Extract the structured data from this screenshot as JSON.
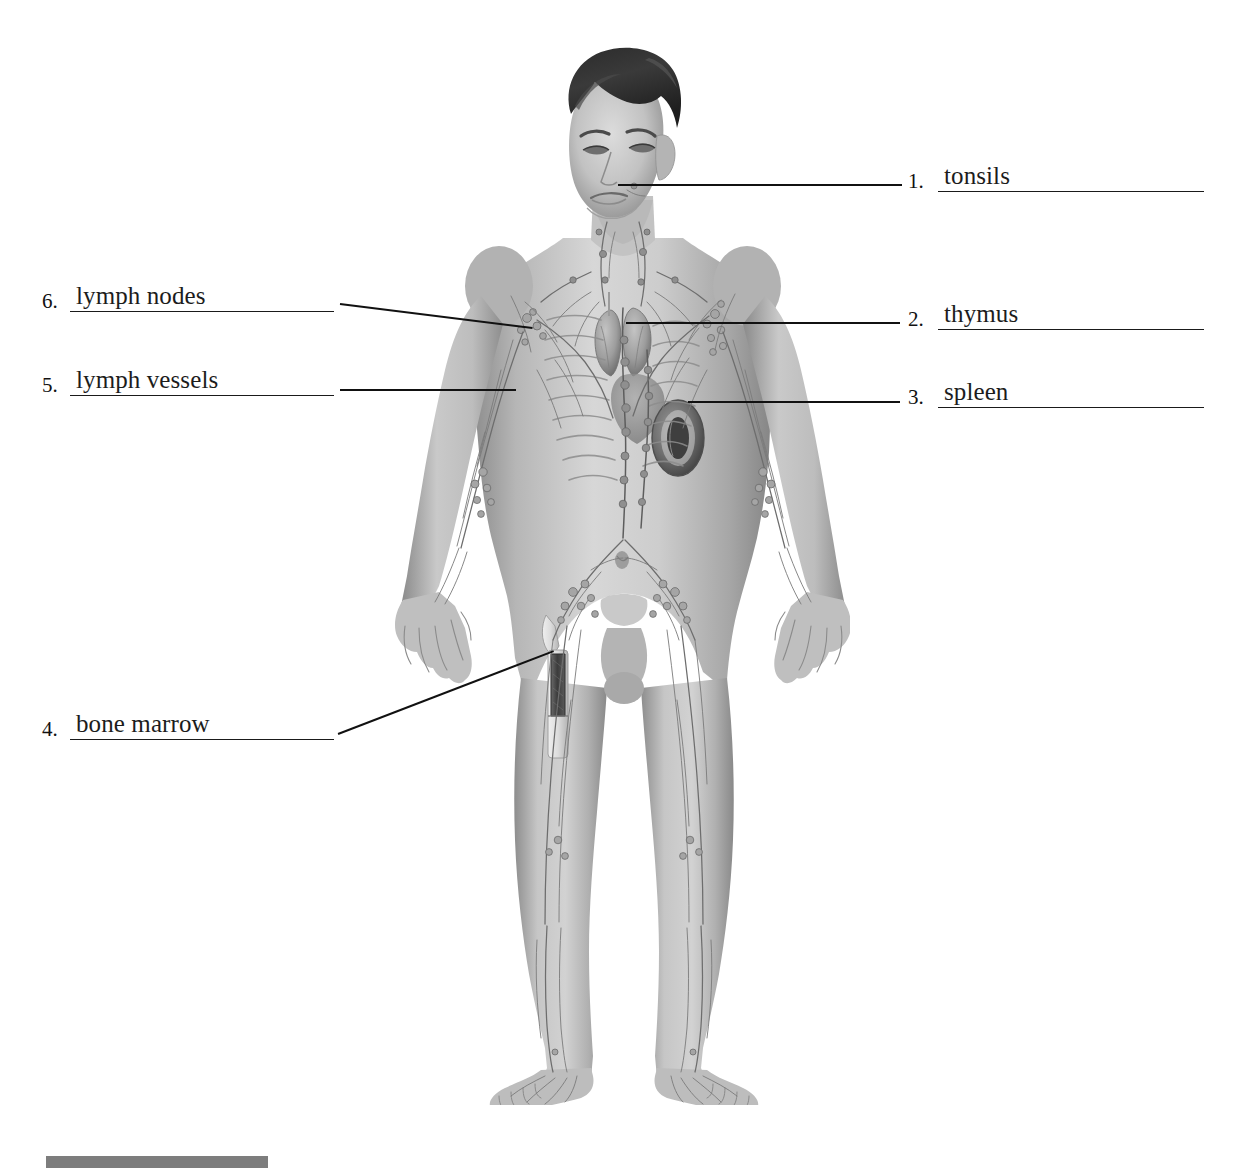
{
  "document": {
    "type": "anatomy-labeling-worksheet",
    "subject": "lymphatic system",
    "background_color": "#ffffff",
    "ink_color": "#111111"
  },
  "figure": {
    "name": "human-body-lymphatic-system-illustration",
    "style": "grayscale photographic rendering",
    "left": 395,
    "top": 40,
    "width": 455,
    "height": 1065
  },
  "labels": [
    {
      "id": 1,
      "number": "1.",
      "answer": "tonsils",
      "side": "right",
      "block_left": 908,
      "block_top": 152,
      "block_height": 40,
      "line_width": 266,
      "leader": {
        "x1": 618,
        "y1": 184,
        "x2": 902,
        "y2": 184
      }
    },
    {
      "id": 2,
      "number": "2.",
      "answer": "thymus",
      "side": "right",
      "block_left": 908,
      "block_top": 290,
      "block_height": 40,
      "line_width": 266,
      "leader": {
        "x1": 626,
        "y1": 322,
        "x2": 900,
        "y2": 322
      }
    },
    {
      "id": 3,
      "number": "3.",
      "answer": "spleen",
      "side": "right",
      "block_left": 908,
      "block_top": 368,
      "block_height": 40,
      "line_width": 266,
      "leader": {
        "x1": 688,
        "y1": 401,
        "x2": 900,
        "y2": 401
      }
    },
    {
      "id": 4,
      "number": "4.",
      "answer": "bone marrow",
      "side": "left",
      "block_left": 42,
      "block_top": 700,
      "block_height": 40,
      "line_width": 264,
      "leader": {
        "x1": 338,
        "y1": 733,
        "x2": 554,
        "y2": 650
      }
    },
    {
      "id": 5,
      "number": "5.",
      "answer": "lymph vessels",
      "side": "left",
      "block_left": 42,
      "block_top": 356,
      "block_height": 40,
      "line_width": 264,
      "leader": {
        "x1": 340,
        "y1": 389,
        "x2": 516,
        "y2": 389
      }
    },
    {
      "id": 6,
      "number": "6.",
      "answer": "lymph nodes",
      "side": "left",
      "block_left": 42,
      "block_top": 272,
      "block_height": 40,
      "line_width": 264,
      "leader": {
        "x1": 340,
        "y1": 303,
        "x2": 533,
        "y2": 327
      }
    }
  ],
  "bottom_bar": {
    "name": "page-footer-bar",
    "color": "#7d7d7d",
    "left": 46,
    "top": 1156,
    "width": 222,
    "height": 12
  }
}
